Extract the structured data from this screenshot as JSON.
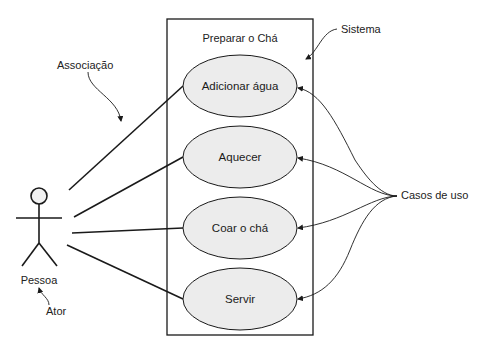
{
  "diagram": {
    "type": "uml-use-case",
    "system": {
      "title": "Preparar o Chá"
    },
    "actor": {
      "name": "Pessoa"
    },
    "use_cases": [
      {
        "label": "Adicionar água"
      },
      {
        "label": "Aquecer"
      },
      {
        "label": "Coar o chá"
      },
      {
        "label": "Servir"
      }
    ],
    "annotations": {
      "association": "Associação",
      "system": "Sistema",
      "use_cases": "Casos de uso",
      "actor": "Ator"
    },
    "colors": {
      "ellipse_fill": "#ececec",
      "stroke": "#1a1a1a",
      "background": "#ffffff"
    }
  }
}
